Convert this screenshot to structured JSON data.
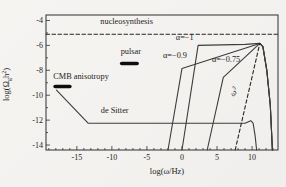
{
  "figure_title": "relic graviton spectra figure",
  "colors": {
    "background": "#f4f3f0",
    "frame": "#2f2f2f",
    "curve": "#3c3c3c",
    "dashed": "#262626",
    "bar": "#0d0d0d",
    "text": "#1c1c1c"
  },
  "chart_data": {
    "type": "line",
    "title": "",
    "xlabel": "log(ω/Hz)",
    "ylabel_parts": {
      "pre": "log(Ω",
      "sub": "g",
      "mid": "h",
      "sup": "2",
      "post": ")"
    },
    "xlim": [
      -19.4,
      13.7
    ],
    "ylim": [
      -14.4,
      -3.56
    ],
    "x_ticks": [
      -15,
      -10,
      -5,
      0,
      5,
      10
    ],
    "y_ticks": [
      -4,
      -6,
      -8,
      -10,
      -12,
      -14
    ],
    "grid": false,
    "legend": "none",
    "series": [
      {
        "name": "nucleosynthesis-bound",
        "style": "dashed",
        "points": [
          [
            -19.4,
            -5.1
          ],
          [
            13.7,
            -5.1
          ]
        ]
      },
      {
        "name": "de-sitter-spectrum",
        "style": "solid",
        "points": [
          [
            -17.9,
            -9.6
          ],
          [
            -13.4,
            -12.25
          ],
          [
            9.0,
            -12.25
          ],
          [
            9.8,
            -12.05
          ],
          [
            10.15,
            -12.25
          ],
          [
            10.45,
            -13.3
          ],
          [
            10.65,
            -14.4
          ]
        ]
      },
      {
        "name": "alpha-minus-1-spectrum",
        "style": "solid",
        "points": [
          [
            0.0,
            -14.4
          ],
          [
            2.3,
            -6.0
          ],
          [
            9.0,
            -5.92
          ],
          [
            10.6,
            -5.86
          ],
          [
            11.1,
            -5.84
          ],
          [
            11.55,
            -6.1
          ],
          [
            12.1,
            -8.0
          ],
          [
            12.6,
            -10.8
          ],
          [
            12.9,
            -14.4
          ]
        ]
      },
      {
        "name": "alpha-minus-0p9-spectrum",
        "style": "solid",
        "points": [
          [
            -2.0,
            -14.4
          ],
          [
            0.0,
            -7.85
          ],
          [
            11.1,
            -5.84
          ],
          [
            11.55,
            -6.1
          ],
          [
            12.1,
            -8.0
          ],
          [
            12.6,
            -10.8
          ],
          [
            12.9,
            -14.4
          ]
        ]
      },
      {
        "name": "alpha-minus-0p75-spectrum",
        "style": "solid",
        "points": [
          [
            3.6,
            -14.4
          ],
          [
            5.9,
            -8.56
          ],
          [
            11.1,
            -5.84
          ],
          [
            11.55,
            -6.1
          ],
          [
            12.1,
            -8.0
          ],
          [
            12.6,
            -10.8
          ],
          [
            12.9,
            -14.4
          ]
        ]
      },
      {
        "name": "omega-cubed-line",
        "style": "dashed",
        "points": [
          [
            7.6,
            -14.4
          ],
          [
            11.1,
            -5.84
          ]
        ]
      }
    ],
    "bars": [
      {
        "name": "cmb-anisotropy-bound",
        "x1": -18.1,
        "x2": -16.0,
        "y": -9.3
      },
      {
        "name": "pulsar-bound",
        "x1": -8.6,
        "x2": -6.4,
        "y": -7.45
      }
    ],
    "annotations": [
      {
        "name": "nucleosynthesis-label",
        "text": "nucleosynthesis",
        "x": -7.9,
        "y": -4.28
      },
      {
        "name": "pulsar-label",
        "text": "pulsar",
        "x": -7.3,
        "y": -6.72
      },
      {
        "name": "cmb-anisotropy-label",
        "text": "CMB anisotropy",
        "x": -14.4,
        "y": -8.72
      },
      {
        "name": "de-sitter-label",
        "text": "de Sitter",
        "x": -9.6,
        "y": -11.45
      },
      {
        "name": "alpha-1-label",
        "text": "α=−1",
        "x": 0.4,
        "y": -5.55
      },
      {
        "name": "alpha-09-label",
        "text": "α=−0.9",
        "x": -1.0,
        "y": -7.0
      },
      {
        "name": "alpha-075-label",
        "text": "α=−0.75",
        "x": 6.3,
        "y": -7.35
      },
      {
        "name": "omega-cubed-label",
        "text": "ω",
        "sup": "3",
        "x": 7.75,
        "y": -9.85,
        "rotate": -55
      }
    ]
  }
}
